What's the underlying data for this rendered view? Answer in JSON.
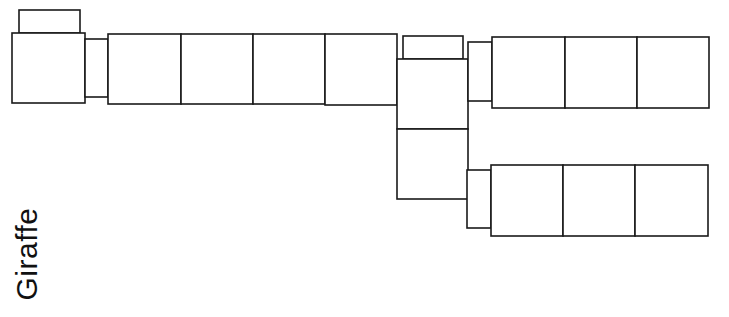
{
  "title": "Giraffe",
  "colors": {
    "stroke": "#1a1a1a",
    "fill": "#ffffff",
    "text": "#111111"
  },
  "diagram": {
    "shapes": [
      {
        "name": "head-top-box",
        "x": 19,
        "y": 10,
        "w": 61,
        "h": 23
      },
      {
        "name": "head-box",
        "x": 12,
        "y": 33,
        "w": 73,
        "h": 70
      },
      {
        "name": "head-neck-connector",
        "x": 85,
        "y": 39,
        "w": 23,
        "h": 58
      },
      {
        "name": "neck-cell-1",
        "x": 108,
        "y": 34,
        "w": 73,
        "h": 70
      },
      {
        "name": "neck-cell-2",
        "x": 181,
        "y": 34,
        "w": 72,
        "h": 70
      },
      {
        "name": "neck-cell-3",
        "x": 253,
        "y": 34,
        "w": 72,
        "h": 70
      },
      {
        "name": "neck-cell-4",
        "x": 325,
        "y": 34,
        "w": 72,
        "h": 71
      },
      {
        "name": "body-top-box",
        "x": 403,
        "y": 36,
        "w": 60,
        "h": 23
      },
      {
        "name": "body-upper-box",
        "x": 397,
        "y": 59,
        "w": 71,
        "h": 70
      },
      {
        "name": "body-lower-box",
        "x": 397,
        "y": 129,
        "w": 71,
        "h": 70
      },
      {
        "name": "upper-leg-connector",
        "x": 468,
        "y": 42,
        "w": 24,
        "h": 59
      },
      {
        "name": "upper-leg-cell-1",
        "x": 492,
        "y": 37,
        "w": 73,
        "h": 71
      },
      {
        "name": "upper-leg-cell-2",
        "x": 565,
        "y": 37,
        "w": 72,
        "h": 71
      },
      {
        "name": "upper-leg-cell-3",
        "x": 637,
        "y": 37,
        "w": 72,
        "h": 71
      },
      {
        "name": "lower-leg-connector",
        "x": 467,
        "y": 170,
        "w": 24,
        "h": 58
      },
      {
        "name": "lower-leg-cell-1",
        "x": 491,
        "y": 165,
        "w": 72,
        "h": 71
      },
      {
        "name": "lower-leg-cell-2",
        "x": 563,
        "y": 165,
        "w": 72,
        "h": 71
      },
      {
        "name": "lower-leg-cell-3",
        "x": 635,
        "y": 165,
        "w": 73,
        "h": 71
      }
    ]
  }
}
